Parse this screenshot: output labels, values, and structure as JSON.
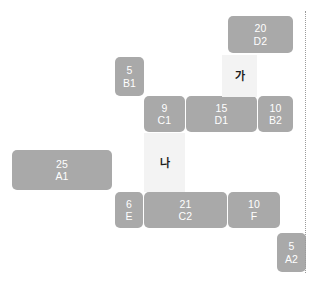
{
  "diagram": {
    "colors": {
      "block_fill": "#a9a9a9",
      "block_text": "#ffffff",
      "band_fill": "#f3f3f3",
      "band_text": "#1c1c1c",
      "boundary_line": "#9b9b9b",
      "background": "#ffffff"
    },
    "blocks": [
      {
        "qty": "20",
        "code": "D2",
        "x": 228,
        "y": 16,
        "w": 65,
        "h": 37
      },
      {
        "qty": "5",
        "code": "B1",
        "x": 115,
        "y": 57,
        "w": 29,
        "h": 39
      },
      {
        "qty": "9",
        "code": "C1",
        "x": 144,
        "y": 96,
        "w": 41,
        "h": 36
      },
      {
        "qty": "15",
        "code": "D1",
        "x": 186,
        "y": 96,
        "w": 71,
        "h": 36
      },
      {
        "qty": "10",
        "code": "B2",
        "x": 258,
        "y": 96,
        "w": 35,
        "h": 36
      },
      {
        "qty": "25",
        "code": "A1",
        "x": 12,
        "y": 150,
        "w": 100,
        "h": 40
      },
      {
        "qty": "6",
        "code": "E",
        "x": 115,
        "y": 192,
        "w": 28,
        "h": 36
      },
      {
        "qty": "21",
        "code": "C2",
        "x": 144,
        "y": 192,
        "w": 83,
        "h": 36
      },
      {
        "qty": "10",
        "code": "F",
        "x": 228,
        "y": 192,
        "w": 52,
        "h": 36
      },
      {
        "qty": "5",
        "code": "A2",
        "x": 277,
        "y": 233,
        "w": 29,
        "h": 39
      }
    ],
    "bands": [
      {
        "label": "가",
        "x": 222,
        "y": 55,
        "w": 35,
        "h": 42
      },
      {
        "label": "나",
        "x": 144,
        "y": 133,
        "w": 41,
        "h": 59
      }
    ],
    "boundary": {
      "name": "right-boundary-line",
      "x": 305,
      "y": 11,
      "height": 262
    }
  }
}
